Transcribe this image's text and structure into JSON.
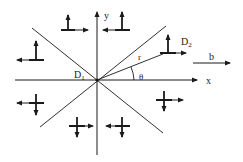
{
  "diagram": {
    "type": "dislocation-interaction-diagram",
    "colors": {
      "stroke": "#1a1a1a",
      "background": "#ffffff"
    },
    "labels": {
      "x_axis": "x",
      "y_axis": "y",
      "origin_dislocation": "D",
      "origin_dislocation_sub": "1",
      "second_dislocation": "D",
      "second_dislocation_sub": "2",
      "radius": "r",
      "angle": "θ",
      "burgers_vector": "b"
    },
    "symbols": [
      {
        "region": "upper-left-top",
        "glide": "right",
        "climb": "up"
      },
      {
        "region": "upper-right-top",
        "glide": "left",
        "climb": "up"
      },
      {
        "region": "left-upper",
        "glide": "left",
        "climb": "up"
      },
      {
        "region": "right-upper (D2)",
        "glide": "right",
        "climb": "up"
      },
      {
        "region": "left-lower",
        "glide": "left",
        "climb": "down"
      },
      {
        "region": "bottom-left",
        "glide": "right",
        "climb": "down"
      },
      {
        "region": "bottom-right",
        "glide": "left",
        "climb": "down"
      },
      {
        "region": "right-lower",
        "glide": "right",
        "climb": "down"
      }
    ]
  }
}
